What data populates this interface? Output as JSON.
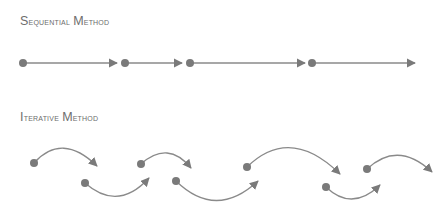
{
  "sections": {
    "sequential": {
      "title_first": "S",
      "title_rest": "equential ",
      "title_second": "M",
      "title_second_rest": "ethod"
    },
    "iterative": {
      "title_first": "I",
      "title_rest": "terative ",
      "title_second": "M",
      "title_second_rest": "ethod"
    }
  },
  "colors": {
    "line": "#8a8a8a",
    "node": "#7a7a7a",
    "text": "#6d6d6d"
  },
  "sequential_steps": [
    {
      "node": [
        23,
        63
      ],
      "arrow_end": [
        117,
        63
      ]
    },
    {
      "node": [
        125,
        63
      ],
      "arrow_end": [
        182,
        63
      ]
    },
    {
      "node": [
        190,
        63
      ],
      "arrow_end": [
        305,
        63
      ]
    },
    {
      "node": [
        312,
        63
      ],
      "arrow_end": [
        415,
        63
      ]
    }
  ],
  "iterative_steps": [
    {
      "node": [
        34,
        163
      ],
      "control": [
        62,
        132
      ],
      "arrow_end": [
        97,
        166
      ]
    },
    {
      "node": [
        85,
        183
      ],
      "control": [
        118,
        212
      ],
      "arrow_end": [
        149,
        178
      ]
    },
    {
      "node": [
        141,
        164
      ],
      "control": [
        168,
        140
      ],
      "arrow_end": [
        191,
        168
      ]
    },
    {
      "node": [
        176,
        181
      ],
      "control": [
        216,
        220
      ],
      "arrow_end": [
        258,
        181
      ]
    },
    {
      "node": [
        247,
        167
      ],
      "control": [
        290,
        125
      ],
      "arrow_end": [
        340,
        174
      ]
    },
    {
      "node": [
        326,
        187
      ],
      "control": [
        352,
        212
      ],
      "arrow_end": [
        380,
        185
      ]
    },
    {
      "node": [
        367,
        169
      ],
      "control": [
        398,
        140
      ],
      "arrow_end": [
        432,
        172
      ]
    }
  ]
}
